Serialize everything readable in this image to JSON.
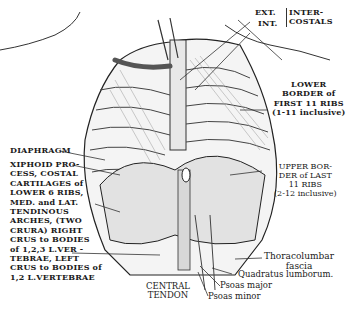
{
  "figure": {
    "labels": {
      "ext": "EXT.",
      "int": "INT.",
      "intercostals": "INTER-\nCOSTALS",
      "lower_border": "LOWER\nBORDER of\nFIRST 11 RIBS\n(1-11 inclusive)",
      "diaphragm": "DIAPHRAGM",
      "xiphoid": "XIPHOID PRO-\nCESS, COSTAL\nCARTILAGES of\nLOWER 6 RIBS,\nMED. and LAT.\nTENDINOUS\nARCHES, (TWO\nCRURA) RIGHT\nCRUS to BODIES\nof 1,2,3 L.VER -\nTEBRAE, LEFT\nCRUS to BODIES of\n1,2 L.VERTEBRAE",
      "upper_border": "UPPER BOR-\nDER of LAST\n11 RIBS\n(2-12 inclusive)",
      "thoracolumbar": "Thoracolumbar\nfascia",
      "quadratus": "Quadratus lumborum.",
      "psoas_major": "Psoas major",
      "psoas_minor": "Psoas minor",
      "central_tendon": "CENTRAL\nTENDON"
    },
    "colors": {
      "ink": "#1a1a1a",
      "paper": "#ffffff",
      "shade": "#6b6b6b"
    }
  }
}
